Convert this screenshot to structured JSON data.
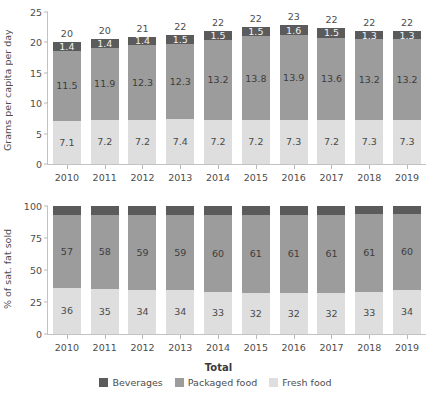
{
  "chart_data": [
    {
      "type": "bar",
      "id": "grams-per-capita",
      "stacked": true,
      "title": "",
      "xlabel": "",
      "ylabel": "Grams per capita per day",
      "ylim": [
        0,
        25
      ],
      "yticks": [
        0,
        5,
        10,
        15,
        20,
        25
      ],
      "grid": false,
      "categories": [
        "2010",
        "2011",
        "2012",
        "2013",
        "2014",
        "2015",
        "2016",
        "2017",
        "2018",
        "2019"
      ],
      "series": [
        {
          "name": "Fresh food",
          "color": "#dedede",
          "values": [
            7.1,
            7.2,
            7.2,
            7.4,
            7.2,
            7.2,
            7.3,
            7.2,
            7.3,
            7.3
          ],
          "labels": [
            "7.1",
            "7.2",
            "7.2",
            "7.4",
            "7.2",
            "7.2",
            "7.3",
            "7.2",
            "7.3",
            "7.3"
          ]
        },
        {
          "name": "Packaged food",
          "color": "#9c9c9c",
          "values": [
            11.5,
            11.9,
            12.3,
            12.3,
            13.2,
            13.8,
            13.9,
            13.6,
            13.2,
            13.2
          ],
          "labels": [
            "11.5",
            "11.9",
            "12.3",
            "12.3",
            "13.2",
            "13.8",
            "13.9",
            "13.6",
            "13.2",
            "13.2"
          ]
        },
        {
          "name": "Beverages",
          "color": "#5b5b5b",
          "values": [
            1.4,
            1.4,
            1.4,
            1.5,
            1.5,
            1.5,
            1.6,
            1.5,
            1.3,
            1.3
          ],
          "labels": [
            "1.4",
            "1.4",
            "1.4",
            "1.5",
            "1.5",
            "1.5",
            "1.6",
            "1.5",
            "1.3",
            "1.3"
          ]
        }
      ],
      "totals": [
        20,
        20,
        21,
        22,
        22,
        22,
        23,
        22,
        22,
        22
      ],
      "total_labels": [
        "20",
        "20",
        "21",
        "22",
        "22",
        "22",
        "23",
        "22",
        "22",
        "22"
      ]
    },
    {
      "type": "bar",
      "id": "share-of-sat-fat",
      "stacked": true,
      "title": "",
      "xlabel": "",
      "ylabel": "% of sat. fat sold",
      "ylim": [
        0,
        100
      ],
      "yticks": [
        0,
        25,
        50,
        75,
        100
      ],
      "grid": false,
      "categories": [
        "2010",
        "2011",
        "2012",
        "2013",
        "2014",
        "2015",
        "2016",
        "2017",
        "2018",
        "2019"
      ],
      "series": [
        {
          "name": "Fresh food",
          "color": "#dedede",
          "values": [
            36,
            35,
            34,
            34,
            33,
            32,
            32,
            32,
            33,
            34
          ],
          "labels": [
            "36",
            "35",
            "34",
            "34",
            "33",
            "32",
            "32",
            "32",
            "33",
            "34"
          ]
        },
        {
          "name": "Packaged food",
          "color": "#9c9c9c",
          "values": [
            57,
            58,
            59,
            59,
            60,
            61,
            61,
            61,
            61,
            60
          ],
          "labels": [
            "57",
            "58",
            "59",
            "59",
            "60",
            "61",
            "61",
            "61",
            "61",
            "60"
          ]
        },
        {
          "name": "Beverages",
          "color": "#5b5b5b",
          "values": [
            7,
            7,
            7,
            7,
            7,
            7,
            7,
            7,
            6,
            6
          ],
          "labels": [
            "",
            "",
            "",
            "",
            "",
            "",
            "",
            "",
            "",
            ""
          ]
        }
      ]
    }
  ],
  "legend": {
    "title": "Total",
    "position": "bottom",
    "items": [
      {
        "label": "Beverages",
        "color": "#5b5b5b"
      },
      {
        "label": "Packaged food",
        "color": "#9c9c9c"
      },
      {
        "label": "Fresh food",
        "color": "#dedede"
      }
    ]
  }
}
